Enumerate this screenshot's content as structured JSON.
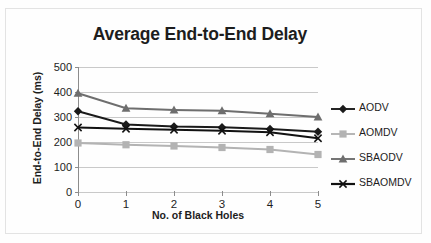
{
  "chart_data": {
    "type": "line",
    "title": "Average End-to-End Delay",
    "xlabel": "No. of Black Holes",
    "ylabel": "End-to-End Delay (ms)",
    "categories": [
      "0",
      "1",
      "2",
      "3",
      "4",
      "5"
    ],
    "x": [
      0,
      1,
      2,
      3,
      4,
      5
    ],
    "xlim": [
      0,
      5
    ],
    "ylim": [
      0,
      500
    ],
    "yticks": [
      0,
      100,
      200,
      300,
      400,
      500
    ],
    "ytick_labels": [
      "0",
      "100",
      "200",
      "300",
      "400",
      "500"
    ],
    "grid": "horizontal",
    "legend_position": "right",
    "series": [
      {
        "name": "AODV",
        "values": [
          323,
          270,
          262,
          259,
          252,
          241
        ],
        "color": "#1a1a1a",
        "marker": "diamond"
      },
      {
        "name": "AOMDV",
        "values": [
          196,
          189,
          184,
          178,
          170,
          150
        ],
        "color": "#b3b3b3",
        "marker": "square"
      },
      {
        "name": "SBAODV",
        "values": [
          395,
          335,
          328,
          325,
          313,
          300
        ],
        "color": "#6e6e6e",
        "marker": "triangle"
      },
      {
        "name": "SBAOMDV",
        "values": [
          258,
          253,
          249,
          245,
          239,
          215
        ],
        "color": "#111111",
        "marker": "cross"
      }
    ]
  },
  "legend": {
    "items": [
      {
        "label": "AODV"
      },
      {
        "label": "AOMDV"
      },
      {
        "label": "SBAODV"
      },
      {
        "label": "SBAOMDV"
      }
    ]
  }
}
